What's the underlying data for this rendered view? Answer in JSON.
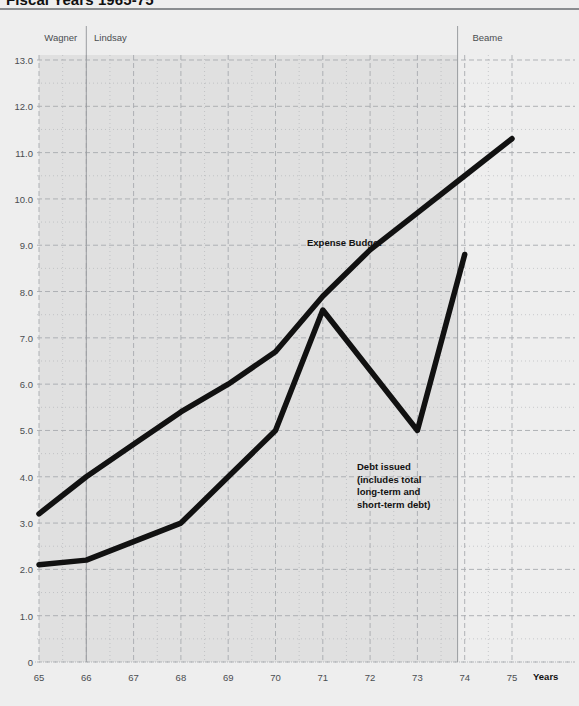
{
  "header": {
    "title": "Fiscal Years 1965-75"
  },
  "annotations": {
    "mayors": [
      {
        "name": "Wagner",
        "x": 65.05
      },
      {
        "name": "Lindsay",
        "x": 66.1
      },
      {
        "name": "Beame",
        "x": 74.1
      }
    ],
    "expense_label": "Expense Budget",
    "debt_label_lines": [
      "Debt issued",
      "(includes total",
      "long-term and",
      "short-term debt)"
    ]
  },
  "chart_data": {
    "type": "line",
    "title": "Fiscal Years 1965-75",
    "xlabel": "Years",
    "ylabel": "",
    "xlim": [
      65,
      75
    ],
    "ylim": [
      0,
      13
    ],
    "grid": true,
    "grid_major_step_y": 1.0,
    "grid_minor_step_y": 0.5,
    "grid_major_step_x": 1.0,
    "grid_minor_step_x": 0.5,
    "legend_position": "inline-annotation",
    "xticks": [
      "65",
      "66",
      "67",
      "68",
      "69",
      "70",
      "71",
      "72",
      "73",
      "74",
      "75"
    ],
    "yticks": [
      "0",
      "1.0",
      "2.0",
      "3.0",
      "4.0",
      "5.0",
      "6.0",
      "7.0",
      "8.0",
      "9.0",
      "10.0",
      "11.0",
      "12.0",
      "13.0"
    ],
    "shaded_band": {
      "from": 65,
      "to": 73.85
    },
    "dividers": [
      66,
      73.85
    ],
    "series": [
      {
        "name": "Expense Budget",
        "color": "#111111",
        "x": [
          65,
          66,
          67,
          68,
          69,
          70,
          71,
          72,
          73,
          74,
          75
        ],
        "values": [
          3.2,
          4.0,
          4.7,
          5.4,
          6.0,
          6.7,
          7.9,
          8.9,
          9.7,
          10.5,
          11.3
        ]
      },
      {
        "name": "Debt issued (includes total long-term and short-term debt)",
        "color": "#111111",
        "x": [
          65,
          66,
          67,
          68,
          69,
          70,
          71,
          72,
          73,
          74
        ],
        "values": [
          2.1,
          2.2,
          2.6,
          3.0,
          4.0,
          5.0,
          7.6,
          6.3,
          5.0,
          8.8
        ]
      }
    ]
  },
  "colors": {
    "background": "#eeeeee",
    "band": "#e0e0e0",
    "line": "#111111",
    "grid": "#a9acb0",
    "axis_text": "#4a4d50",
    "rule": "#8a8d90"
  }
}
